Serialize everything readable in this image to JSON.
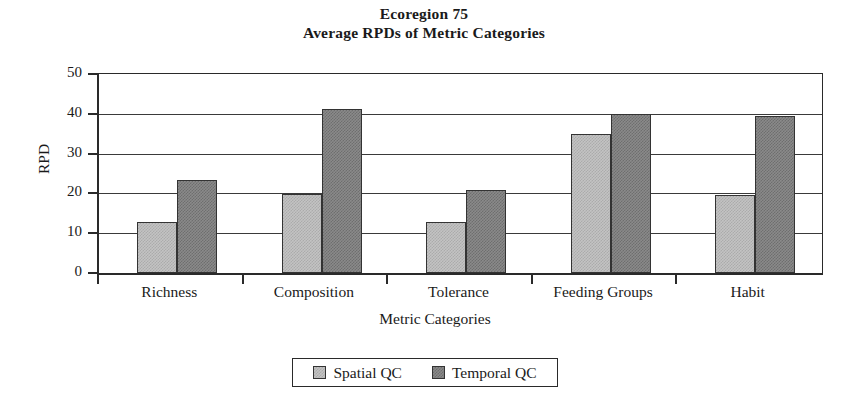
{
  "chart_data": {
    "type": "bar",
    "title": "Ecoregion 75",
    "subtitle": "Average RPDs of Metric Categories",
    "xlabel": "Metric Categories",
    "ylabel": "RPD",
    "ylim": [
      0,
      50
    ],
    "ytick_labels": [
      "50",
      "40",
      "30",
      "20",
      "10",
      "0"
    ],
    "ytick_values": [
      50,
      40,
      30,
      20,
      10,
      0
    ],
    "grid": "horizontal",
    "legend_position": "bottom-center",
    "categories": [
      "Richness",
      "Composition",
      "Tolerance",
      "Feeding Groups",
      "Habit"
    ],
    "series": [
      {
        "name": "Spatial QC",
        "color": "#c3c3c3",
        "values": [
          12.8,
          19.8,
          12.9,
          34.9,
          19.7
        ]
      },
      {
        "name": "Temporal QC",
        "color": "#8a8a8a",
        "values": [
          23.4,
          41.3,
          20.9,
          40.0,
          39.5
        ]
      }
    ]
  },
  "legend": {
    "entries": [
      {
        "label": "Spatial QC",
        "swatch": "light-grey-swatch"
      },
      {
        "label": "Temporal QC",
        "swatch": "dark-grey-swatch"
      }
    ]
  }
}
